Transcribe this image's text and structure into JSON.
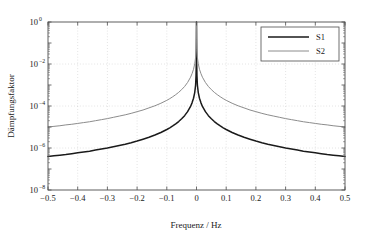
{
  "chart_data": {
    "type": "line",
    "title": "",
    "xlabel": "Frequenz / Hz",
    "ylabel": "Dämpfungsfaktor",
    "xlim": [
      -0.5,
      0.5
    ],
    "ylim": [
      1e-08,
      1
    ],
    "yscale": "log",
    "xscale": "linear",
    "grid": true,
    "grid_style": "dotted",
    "legend_position": "top-right",
    "xticks": [
      -0.5,
      -0.4,
      -0.3,
      -0.2,
      -0.1,
      0,
      0.1,
      0.2,
      0.3,
      0.4,
      0.5
    ],
    "xtick_labels": [
      "-0.5",
      "-0.4",
      "-0.3",
      "-0.2",
      "-0.1",
      "0",
      "0.1",
      "0.2",
      "0.3",
      "0.4",
      "0.5"
    ],
    "yticks": [
      1,
      0.01,
      0.0001,
      1e-06,
      1e-08
    ],
    "ytick_labels": [
      "10^0",
      "10^-2",
      "10^-4",
      "10^-6",
      "10^-8"
    ],
    "ytick_mantissa": [
      "10",
      "10",
      "10",
      "10",
      "10"
    ],
    "ytick_exponents": [
      "0",
      "-2",
      "-4",
      "-6",
      "-8"
    ],
    "series": [
      {
        "name": "S1",
        "color": "#1a1a1a",
        "width": 1.5,
        "x": [
          -0.5,
          -0.48,
          -0.46,
          -0.44,
          -0.42,
          -0.4,
          -0.38,
          -0.36,
          -0.34,
          -0.32,
          -0.3,
          -0.28,
          -0.26,
          -0.24,
          -0.22,
          -0.2,
          -0.18,
          -0.16,
          -0.14,
          -0.12,
          -0.1,
          -0.09,
          -0.08,
          -0.07,
          -0.06,
          -0.05,
          -0.04,
          -0.03,
          -0.02,
          -0.015,
          -0.01,
          -0.006,
          -0.003,
          -0.0015,
          -0.0006,
          0,
          0.0006,
          0.0015,
          0.003,
          0.006,
          0.01,
          0.015,
          0.02,
          0.03,
          0.04,
          0.05,
          0.06,
          0.07,
          0.08,
          0.09,
          0.1,
          0.12,
          0.14,
          0.16,
          0.18,
          0.2,
          0.22,
          0.24,
          0.26,
          0.28,
          0.3,
          0.32,
          0.34,
          0.36,
          0.38,
          0.4,
          0.42,
          0.44,
          0.46,
          0.48,
          0.5
        ],
        "y_log10": [
          -6.4,
          -6.37,
          -6.34,
          -6.31,
          -6.27,
          -6.23,
          -6.19,
          -6.15,
          -6.1,
          -6.05,
          -6.0,
          -5.94,
          -5.88,
          -5.82,
          -5.75,
          -5.67,
          -5.58,
          -5.49,
          -5.38,
          -5.26,
          -5.12,
          -5.04,
          -4.95,
          -4.85,
          -4.74,
          -4.61,
          -4.46,
          -4.27,
          -4.02,
          -3.85,
          -3.63,
          -3.36,
          -3.0,
          -2.55,
          -1.95,
          0,
          -1.95,
          -2.55,
          -3.0,
          -3.36,
          -3.63,
          -3.85,
          -4.02,
          -4.27,
          -4.46,
          -4.61,
          -4.74,
          -4.85,
          -4.95,
          -5.04,
          -5.12,
          -5.26,
          -5.38,
          -5.49,
          -5.58,
          -5.67,
          -5.75,
          -5.82,
          -5.88,
          -5.94,
          -6.0,
          -6.05,
          -6.1,
          -6.15,
          -6.19,
          -6.23,
          -6.27,
          -6.31,
          -6.34,
          -6.37,
          -6.4
        ]
      },
      {
        "name": "S2",
        "color": "#8c8c8c",
        "width": 1.0,
        "x": [
          -0.5,
          -0.48,
          -0.46,
          -0.44,
          -0.42,
          -0.4,
          -0.38,
          -0.36,
          -0.34,
          -0.32,
          -0.3,
          -0.28,
          -0.26,
          -0.24,
          -0.22,
          -0.2,
          -0.18,
          -0.16,
          -0.14,
          -0.12,
          -0.1,
          -0.09,
          -0.08,
          -0.07,
          -0.06,
          -0.05,
          -0.04,
          -0.03,
          -0.02,
          -0.015,
          -0.01,
          -0.006,
          -0.003,
          -0.0015,
          -0.0006,
          0,
          0.0006,
          0.0015,
          0.003,
          0.006,
          0.01,
          0.015,
          0.02,
          0.03,
          0.04,
          0.05,
          0.06,
          0.07,
          0.08,
          0.09,
          0.1,
          0.12,
          0.14,
          0.16,
          0.18,
          0.2,
          0.22,
          0.24,
          0.26,
          0.28,
          0.3,
          0.32,
          0.34,
          0.36,
          0.38,
          0.4,
          0.42,
          0.44,
          0.46,
          0.48,
          0.5
        ],
        "y_log10": [
          -5.0,
          -4.97,
          -4.94,
          -4.9,
          -4.87,
          -4.83,
          -4.79,
          -4.75,
          -4.7,
          -4.65,
          -4.6,
          -4.54,
          -4.48,
          -4.42,
          -4.35,
          -4.27,
          -4.19,
          -4.09,
          -3.99,
          -3.87,
          -3.73,
          -3.65,
          -3.56,
          -3.46,
          -3.35,
          -3.22,
          -3.07,
          -2.88,
          -2.63,
          -2.46,
          -2.25,
          -1.99,
          -1.68,
          -1.32,
          -0.82,
          0,
          -0.82,
          -1.32,
          -1.68,
          -1.99,
          -2.25,
          -2.46,
          -2.63,
          -2.88,
          -3.07,
          -3.22,
          -3.35,
          -3.46,
          -3.56,
          -3.65,
          -3.73,
          -3.87,
          -3.99,
          -4.09,
          -4.19,
          -4.27,
          -4.35,
          -4.42,
          -4.48,
          -4.54,
          -4.6,
          -4.65,
          -4.7,
          -4.75,
          -4.79,
          -4.83,
          -4.87,
          -4.9,
          -4.94,
          -4.97,
          -5.0
        ]
      }
    ]
  },
  "legend": {
    "entries": [
      {
        "label": "S1"
      },
      {
        "label": "S2"
      }
    ]
  },
  "colors": {
    "series1": "#1a1a1a",
    "series2": "#8c8c8c",
    "axis": "#4d4d4d",
    "grid": "#b3b3b3",
    "background": "#ffffff"
  }
}
